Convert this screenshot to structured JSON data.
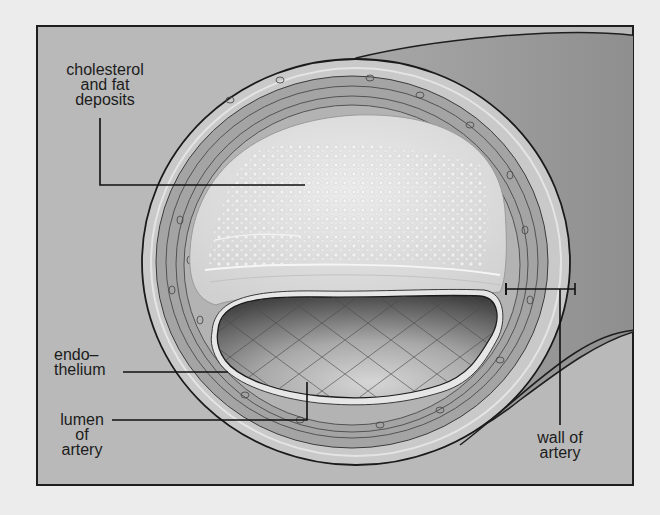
{
  "figure": {
    "colors": {
      "page_background": "#ececec",
      "frame_background": "#b9b9b9",
      "frame_border": "#1e1e1e",
      "artery_tube": "#9e9e9e",
      "adventitia": "#c8c8c8",
      "media_layer": "#a3a3a3",
      "plaque": "#dedede",
      "lumen_dark": "#5a5a5a",
      "lumen_light": "#c4c4c4",
      "leader_line": "#111111",
      "label_text": "#1c1c1c"
    }
  },
  "labels": {
    "cholesterol": {
      "lines": [
        "cholesterol",
        "and fat",
        "deposits"
      ],
      "target": "plaque"
    },
    "endothelium": {
      "lines": [
        "endo–",
        "thelium"
      ],
      "target": "inner lining"
    },
    "lumen": {
      "lines": [
        "lumen",
        "of",
        "artery"
      ],
      "target": "lumen"
    },
    "wall": {
      "lines": [
        "wall of",
        "artery"
      ],
      "target": "artery wall"
    }
  }
}
